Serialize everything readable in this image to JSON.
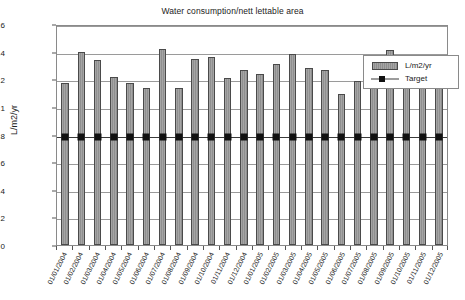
{
  "chart_data": {
    "type": "bar",
    "title": "Water consumption/nett lettable area",
    "xlabel": "",
    "ylabel": "L/m2/yr",
    "ylim": [
      0,
      1.6
    ],
    "yticks": [
      0,
      0.2,
      0.4,
      0.6,
      0.8,
      1,
      1.2,
      1.4,
      1.6
    ],
    "ytick_labels": [
      "0",
      "0.2",
      "0.4",
      "0.6",
      "0.8",
      "1",
      "1.2",
      "1.4",
      "1.6"
    ],
    "grid": true,
    "legend_position": "top-right",
    "categories": [
      "01/01/2004",
      "01/02/2004",
      "01/03/2004",
      "01/04/2004",
      "01/05/2004",
      "01/06/2004",
      "01/07/2004",
      "01/08/2004",
      "01/09/2004",
      "01/10/2004",
      "01/11/2004",
      "01/12/2004",
      "01/01/2005",
      "01/02/2005",
      "01/03/2005",
      "01/04/2005",
      "01/05/2005",
      "01/06/2005",
      "01/07/2005",
      "01/08/2005",
      "01/09/2005",
      "01/10/2005",
      "01/11/2005",
      "01/12/2005"
    ],
    "series": [
      {
        "name": "L/m2/yr",
        "type": "bar",
        "color": "#999999",
        "values": [
          1.17,
          1.4,
          1.34,
          1.22,
          1.17,
          1.14,
          1.42,
          1.14,
          1.35,
          1.36,
          1.21,
          1.27,
          1.24,
          1.31,
          1.38,
          1.28,
          1.27,
          1.09,
          1.19,
          1.24,
          1.41,
          1.35,
          1.28,
          1.14
        ]
      },
      {
        "name": "Target",
        "type": "line",
        "color": "#111111",
        "values": [
          0.8,
          0.8,
          0.8,
          0.8,
          0.8,
          0.8,
          0.8,
          0.8,
          0.8,
          0.8,
          0.8,
          0.8,
          0.8,
          0.8,
          0.8,
          0.8,
          0.8,
          0.8,
          0.8,
          0.8,
          0.8,
          0.8,
          0.8,
          0.8
        ]
      }
    ]
  },
  "legend": {
    "items": [
      {
        "label": "L/m2/yr"
      },
      {
        "label": "Target"
      }
    ]
  }
}
